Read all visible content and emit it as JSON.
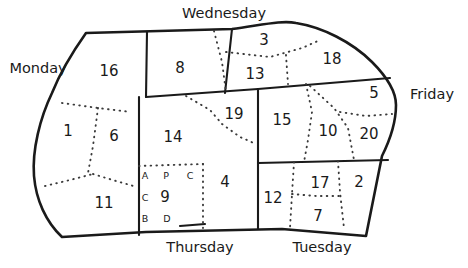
{
  "diagram": {
    "type": "irregular-region-map",
    "title": "",
    "background_color": "#ffffff",
    "line_color": "#1a1a1a",
    "outline_style": "solid-thick",
    "interior_styles": [
      "solid",
      "dotted"
    ],
    "day_labels": [
      {
        "name": "monday",
        "text": "Monday",
        "x": 38,
        "y": 69
      },
      {
        "name": "wednesday",
        "text": "Wednesday",
        "x": 224,
        "y": 14
      },
      {
        "name": "friday",
        "text": "Friday",
        "x": 432,
        "y": 95
      },
      {
        "name": "thursday",
        "text": "Thursday",
        "x": 200,
        "y": 248
      },
      {
        "name": "tuesday",
        "text": "Tuesday",
        "x": 322,
        "y": 248
      }
    ],
    "regions": [
      {
        "id": "region-16",
        "label": "16",
        "x": 109,
        "y": 71
      },
      {
        "id": "region-8",
        "label": "8",
        "x": 180,
        "y": 68
      },
      {
        "id": "region-3",
        "label": "3",
        "x": 264,
        "y": 40
      },
      {
        "id": "region-13",
        "label": "13",
        "x": 255,
        "y": 74
      },
      {
        "id": "region-18",
        "label": "18",
        "x": 332,
        "y": 59
      },
      {
        "id": "region-5",
        "label": "5",
        "x": 374,
        "y": 93
      },
      {
        "id": "region-1",
        "label": "1",
        "x": 68,
        "y": 131
      },
      {
        "id": "region-6",
        "label": "6",
        "x": 114,
        "y": 136
      },
      {
        "id": "region-14",
        "label": "14",
        "x": 173,
        "y": 137
      },
      {
        "id": "region-19",
        "label": "19",
        "x": 234,
        "y": 114
      },
      {
        "id": "region-15",
        "label": "15",
        "x": 282,
        "y": 120
      },
      {
        "id": "region-10",
        "label": "10",
        "x": 328,
        "y": 131
      },
      {
        "id": "region-20",
        "label": "20",
        "x": 369,
        "y": 134
      },
      {
        "id": "region-11",
        "label": "11",
        "x": 104,
        "y": 203
      },
      {
        "id": "region-9",
        "label": "9",
        "x": 165,
        "y": 197
      },
      {
        "id": "region-4",
        "label": "4",
        "x": 225,
        "y": 182
      },
      {
        "id": "region-12",
        "label": "12",
        "x": 273,
        "y": 198
      },
      {
        "id": "region-17",
        "label": "17",
        "x": 320,
        "y": 183
      },
      {
        "id": "region-2",
        "label": "2",
        "x": 359,
        "y": 182
      },
      {
        "id": "region-7",
        "label": "7",
        "x": 318,
        "y": 216
      }
    ],
    "subcell_letters": [
      {
        "id": "letter-a",
        "label": "A",
        "x": 145,
        "y": 176
      },
      {
        "id": "letter-p",
        "label": "P",
        "x": 166,
        "y": 176
      },
      {
        "id": "letter-c-top",
        "label": "C",
        "x": 190,
        "y": 176
      },
      {
        "id": "letter-c-mid",
        "label": "C",
        "x": 145,
        "y": 198
      },
      {
        "id": "letter-b",
        "label": "B",
        "x": 145,
        "y": 219
      },
      {
        "id": "letter-d",
        "label": "D",
        "x": 167,
        "y": 219
      }
    ]
  }
}
